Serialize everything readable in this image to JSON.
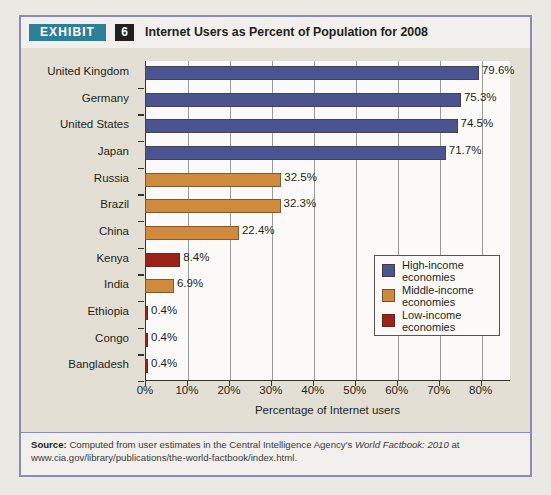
{
  "header": {
    "exhibit_label": "EXHIBIT",
    "exhibit_number": "6",
    "title": "Internet Users as Percent of Population for 2008"
  },
  "source": {
    "label": "Source:",
    "text_part1": " Computed from user estimates in the Central Intelligence Agency's ",
    "italic": "World Factbook: 2010",
    "text_part2": " at www.cia.gov/library/publications/the-world-factbook/index.html."
  },
  "legend": {
    "position": "inside-right",
    "items": [
      {
        "label": "High-income\neconomies",
        "color": "#4a5490"
      },
      {
        "label": "Middle-income\neconomies",
        "color": "#d08a3e"
      },
      {
        "label": "Low-income\neconomies",
        "color": "#9b2218"
      }
    ]
  },
  "chart_data": {
    "type": "bar",
    "orientation": "horizontal",
    "title": "Internet Users as Percent of Population for 2008",
    "xlabel": "Percentage of Internet users",
    "ylabel": "",
    "xlim": [
      0,
      87
    ],
    "xticks": [
      0,
      10,
      20,
      30,
      40,
      50,
      60,
      70,
      80
    ],
    "xtick_labels": [
      "0%",
      "10%",
      "20%",
      "30%",
      "40%",
      "50%",
      "60%",
      "70%",
      "80%"
    ],
    "grid": "vertical",
    "categories": [
      "United Kingdom",
      "Germany",
      "United States",
      "Japan",
      "Russia",
      "Brazil",
      "China",
      "Kenya",
      "India",
      "Ethiopia",
      "Congo",
      "Bangladesh"
    ],
    "values": [
      79.6,
      75.3,
      74.5,
      71.7,
      32.5,
      32.3,
      22.4,
      8.4,
      6.9,
      0.4,
      0.4,
      0.4
    ],
    "value_labels": [
      "79.6%",
      "75.3%",
      "74.5%",
      "71.7%",
      "32.5%",
      "32.3%",
      "22.4%",
      "8.4%",
      "6.9%",
      "0.4%",
      "0.4%",
      "0.4%"
    ],
    "groups": [
      "High-income",
      "High-income",
      "High-income",
      "High-income",
      "Middle-income",
      "Middle-income",
      "Middle-income",
      "Low-income",
      "Middle-income",
      "Low-income",
      "Low-income",
      "Low-income"
    ],
    "group_colors": {
      "High-income": "#4a5490",
      "Middle-income": "#d08a3e",
      "Low-income": "#9b2218"
    }
  }
}
